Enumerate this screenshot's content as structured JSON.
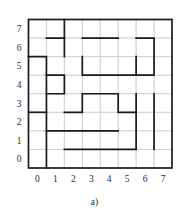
{
  "figure": {
    "caption": "a)",
    "axes": {
      "x_ticks": [
        "0",
        "1",
        "2",
        "3",
        "4",
        "5",
        "6",
        "7"
      ],
      "y_ticks": [
        "0",
        "1",
        "2",
        "3",
        "4",
        "5",
        "6",
        "7"
      ],
      "x_range": [
        -0.5,
        7.5
      ],
      "y_range": [
        -0.5,
        7.5
      ],
      "grid": true,
      "grid_color": "#c9c9c9",
      "frame_color": "#1a1a1a"
    },
    "style": {
      "background": "#ffffff",
      "path_color": "#1a1a1a",
      "path_width": 1.7,
      "frame_width": 1.7,
      "grid_width": 0.6,
      "tick_color": "#2b2b2b"
    }
  },
  "chart_data": {
    "type": "line",
    "title": "",
    "xlabel": "",
    "ylabel": "",
    "xlim": [
      -0.5,
      7.5
    ],
    "ylim": [
      -0.5,
      7.5
    ],
    "grid": true,
    "categories": [
      "0",
      "1",
      "2",
      "3",
      "4",
      "5",
      "6",
      "7"
    ],
    "series": [
      {
        "name": "segment-1",
        "kind": "polyline",
        "points": [
          [
            -0.5,
            5.5
          ],
          [
            0.5,
            5.5
          ],
          [
            0.5,
            -0.5
          ]
        ]
      },
      {
        "name": "segment-2",
        "kind": "polyline",
        "points": [
          [
            -0.5,
            2.5
          ],
          [
            0.5,
            2.5
          ]
        ]
      },
      {
        "name": "segment-3",
        "kind": "polyline",
        "points": [
          [
            0.5,
            6.5
          ],
          [
            1.5,
            6.5
          ],
          [
            1.5,
            7.5
          ]
        ]
      },
      {
        "name": "segment-4",
        "kind": "polyline",
        "points": [
          [
            1.5,
            5.5
          ],
          [
            1.5,
            6.5
          ]
        ]
      },
      {
        "name": "segment-5",
        "kind": "polyline",
        "points": [
          [
            0.5,
            4.5
          ],
          [
            1.5,
            4.5
          ],
          [
            1.5,
            3.5
          ],
          [
            0.5,
            3.5
          ]
        ]
      },
      {
        "name": "segment-6",
        "kind": "polyline",
        "points": [
          [
            2.5,
            6.5
          ],
          [
            4.5,
            6.5
          ]
        ]
      },
      {
        "name": "segment-7",
        "kind": "polyline",
        "points": [
          [
            2.5,
            5.5
          ],
          [
            2.5,
            4.5
          ],
          [
            5.5,
            4.5
          ],
          [
            5.5,
            5.5
          ]
        ]
      },
      {
        "name": "segment-8",
        "kind": "polyline",
        "points": [
          [
            1.5,
            2.5
          ],
          [
            2.5,
            2.5
          ],
          [
            2.5,
            3.5
          ],
          [
            4.5,
            3.5
          ],
          [
            4.5,
            2.5
          ],
          [
            5.5,
            2.5
          ],
          [
            5.5,
            3.5
          ]
        ]
      },
      {
        "name": "segment-9",
        "kind": "polyline",
        "points": [
          [
            5.5,
            4.5
          ],
          [
            6.5,
            4.5
          ],
          [
            6.5,
            6.5
          ],
          [
            5.5,
            6.5
          ]
        ]
      },
      {
        "name": "segment-10",
        "kind": "polyline",
        "points": [
          [
            0.5,
            1.5
          ],
          [
            4.5,
            1.5
          ]
        ]
      },
      {
        "name": "segment-11",
        "kind": "polyline",
        "points": [
          [
            1.5,
            0.5
          ],
          [
            5.5,
            0.5
          ],
          [
            5.5,
            2.5
          ]
        ]
      },
      {
        "name": "segment-12",
        "kind": "polyline",
        "points": [
          [
            6.5,
            0.5
          ],
          [
            6.5,
            3.5
          ]
        ]
      }
    ]
  }
}
